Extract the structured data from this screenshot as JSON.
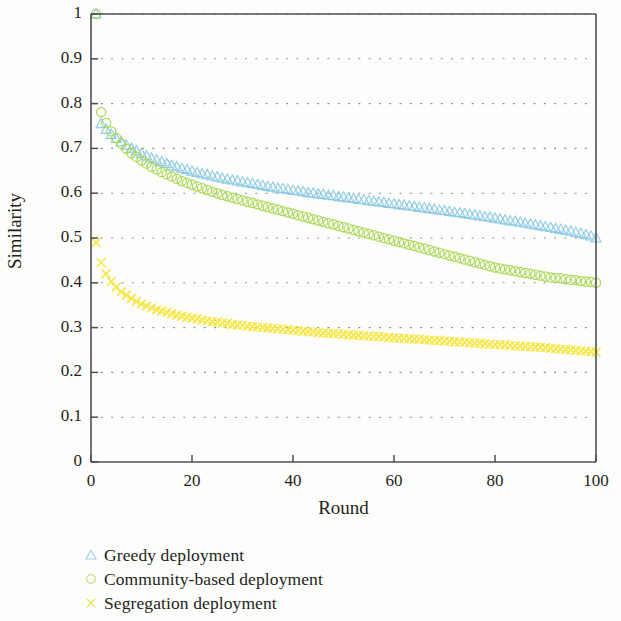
{
  "chart_data": {
    "type": "scatter",
    "title": "",
    "xlabel": "Round",
    "ylabel": "Similarity",
    "xlim": [
      0,
      100
    ],
    "ylim": [
      0,
      1
    ],
    "xticks": [
      "0",
      "20",
      "40",
      "60",
      "80",
      "100"
    ],
    "xtick_values": [
      0,
      20,
      40,
      60,
      80,
      100
    ],
    "yticks": [
      "0",
      "0.1",
      "0.2",
      "0.3",
      "0.4",
      "0.5",
      "0.6",
      "0.7",
      "0.8",
      "0.9",
      "1"
    ],
    "ytick_values": [
      0,
      0.1,
      0.2,
      0.3,
      0.4,
      0.5,
      0.6,
      0.7,
      0.8,
      0.9,
      1.0
    ],
    "grid": "dotted",
    "legend_position": "below-axes-left",
    "series": [
      {
        "name": "Greedy deployment",
        "marker": "triangle",
        "color": "#8ecae6",
        "x": [
          1,
          2,
          3,
          4,
          5,
          6,
          7,
          8,
          9,
          10,
          11,
          12,
          13,
          14,
          15,
          16,
          17,
          18,
          19,
          20,
          21,
          22,
          23,
          24,
          25,
          26,
          27,
          28,
          29,
          30,
          31,
          32,
          33,
          34,
          35,
          36,
          37,
          38,
          39,
          40,
          41,
          42,
          43,
          44,
          45,
          46,
          47,
          48,
          49,
          50,
          51,
          52,
          53,
          54,
          55,
          56,
          57,
          58,
          59,
          60,
          61,
          62,
          63,
          64,
          65,
          66,
          67,
          68,
          69,
          70,
          71,
          72,
          73,
          74,
          75,
          76,
          77,
          78,
          79,
          80,
          81,
          82,
          83,
          84,
          85,
          86,
          87,
          88,
          89,
          90,
          91,
          92,
          93,
          94,
          95,
          96,
          97,
          98,
          99,
          100
        ],
        "y": [
          1.0,
          0.755,
          0.742,
          0.731,
          0.722,
          0.714,
          0.707,
          0.7,
          0.694,
          0.688,
          0.683,
          0.678,
          0.674,
          0.67,
          0.666,
          0.662,
          0.659,
          0.655,
          0.652,
          0.649,
          0.646,
          0.643,
          0.641,
          0.638,
          0.636,
          0.633,
          0.631,
          0.629,
          0.627,
          0.625,
          0.623,
          0.621,
          0.619,
          0.617,
          0.615,
          0.613,
          0.611,
          0.61,
          0.608,
          0.606,
          0.605,
          0.603,
          0.601,
          0.6,
          0.598,
          0.597,
          0.595,
          0.594,
          0.592,
          0.591,
          0.589,
          0.588,
          0.586,
          0.585,
          0.583,
          0.582,
          0.58,
          0.579,
          0.577,
          0.576,
          0.574,
          0.573,
          0.571,
          0.57,
          0.568,
          0.567,
          0.565,
          0.564,
          0.562,
          0.561,
          0.559,
          0.557,
          0.556,
          0.554,
          0.552,
          0.551,
          0.549,
          0.547,
          0.546,
          0.544,
          0.542,
          0.54,
          0.538,
          0.537,
          0.535,
          0.533,
          0.531,
          0.529,
          0.527,
          0.525,
          0.523,
          0.521,
          0.519,
          0.517,
          0.515,
          0.512,
          0.51,
          0.507,
          0.504,
          0.5
        ]
      },
      {
        "name": "Community-based deployment",
        "marker": "circle",
        "color": "#a5d84f",
        "x": [
          1,
          2,
          3,
          4,
          5,
          6,
          7,
          8,
          9,
          10,
          11,
          12,
          13,
          14,
          15,
          16,
          17,
          18,
          19,
          20,
          21,
          22,
          23,
          24,
          25,
          26,
          27,
          28,
          29,
          30,
          31,
          32,
          33,
          34,
          35,
          36,
          37,
          38,
          39,
          40,
          41,
          42,
          43,
          44,
          45,
          46,
          47,
          48,
          49,
          50,
          51,
          52,
          53,
          54,
          55,
          56,
          57,
          58,
          59,
          60,
          61,
          62,
          63,
          64,
          65,
          66,
          67,
          68,
          69,
          70,
          71,
          72,
          73,
          74,
          75,
          76,
          77,
          78,
          79,
          80,
          81,
          82,
          83,
          84,
          85,
          86,
          87,
          88,
          89,
          90,
          91,
          92,
          93,
          94,
          95,
          96,
          97,
          98,
          99,
          100
        ],
        "y": [
          1.0,
          0.781,
          0.757,
          0.738,
          0.723,
          0.71,
          0.699,
          0.689,
          0.681,
          0.673,
          0.666,
          0.659,
          0.653,
          0.647,
          0.642,
          0.637,
          0.632,
          0.627,
          0.623,
          0.619,
          0.615,
          0.611,
          0.607,
          0.603,
          0.6,
          0.596,
          0.593,
          0.59,
          0.587,
          0.584,
          0.581,
          0.578,
          0.575,
          0.572,
          0.569,
          0.566,
          0.563,
          0.56,
          0.557,
          0.554,
          0.551,
          0.548,
          0.545,
          0.542,
          0.539,
          0.536,
          0.533,
          0.53,
          0.527,
          0.524,
          0.521,
          0.518,
          0.515,
          0.512,
          0.509,
          0.506,
          0.503,
          0.5,
          0.497,
          0.494,
          0.491,
          0.488,
          0.485,
          0.482,
          0.479,
          0.476,
          0.473,
          0.47,
          0.467,
          0.464,
          0.461,
          0.458,
          0.455,
          0.452,
          0.449,
          0.446,
          0.443,
          0.44,
          0.437,
          0.434,
          0.432,
          0.43,
          0.428,
          0.426,
          0.424,
          0.422,
          0.42,
          0.418,
          0.416,
          0.414,
          0.412,
          0.411,
          0.41,
          0.408,
          0.407,
          0.406,
          0.404,
          0.403,
          0.402,
          0.4
        ]
      },
      {
        "name": "Segregation deployment",
        "marker": "x",
        "color": "#f5e642",
        "x": [
          1,
          2,
          3,
          4,
          5,
          6,
          7,
          8,
          9,
          10,
          11,
          12,
          13,
          14,
          15,
          16,
          17,
          18,
          19,
          20,
          21,
          22,
          23,
          24,
          25,
          26,
          27,
          28,
          29,
          30,
          31,
          32,
          33,
          34,
          35,
          36,
          37,
          38,
          39,
          40,
          41,
          42,
          43,
          44,
          45,
          46,
          47,
          48,
          49,
          50,
          51,
          52,
          53,
          54,
          55,
          56,
          57,
          58,
          59,
          60,
          61,
          62,
          63,
          64,
          65,
          66,
          67,
          68,
          69,
          70,
          71,
          72,
          73,
          74,
          75,
          76,
          77,
          78,
          79,
          80,
          81,
          82,
          83,
          84,
          85,
          86,
          87,
          88,
          89,
          90,
          91,
          92,
          93,
          94,
          95,
          96,
          97,
          98,
          99,
          100
        ],
        "y": [
          0.49,
          0.445,
          0.42,
          0.403,
          0.39,
          0.38,
          0.372,
          0.365,
          0.359,
          0.353,
          0.348,
          0.344,
          0.34,
          0.337,
          0.334,
          0.331,
          0.328,
          0.326,
          0.323,
          0.321,
          0.319,
          0.317,
          0.315,
          0.313,
          0.312,
          0.31,
          0.309,
          0.307,
          0.306,
          0.305,
          0.303,
          0.302,
          0.301,
          0.3,
          0.299,
          0.298,
          0.297,
          0.296,
          0.295,
          0.294,
          0.293,
          0.292,
          0.291,
          0.29,
          0.289,
          0.288,
          0.287,
          0.287,
          0.286,
          0.285,
          0.284,
          0.283,
          0.283,
          0.282,
          0.281,
          0.28,
          0.28,
          0.279,
          0.278,
          0.277,
          0.277,
          0.276,
          0.275,
          0.274,
          0.274,
          0.273,
          0.272,
          0.271,
          0.271,
          0.27,
          0.269,
          0.268,
          0.268,
          0.267,
          0.266,
          0.265,
          0.265,
          0.264,
          0.263,
          0.262,
          0.262,
          0.261,
          0.26,
          0.259,
          0.259,
          0.258,
          0.257,
          0.256,
          0.256,
          0.255,
          0.254,
          0.253,
          0.252,
          0.251,
          0.25,
          0.249,
          0.248,
          0.247,
          0.246,
          0.245
        ]
      }
    ]
  },
  "axes": {
    "ylabel": "Similarity",
    "xlabel": "Round"
  },
  "legend": {
    "items": [
      {
        "label": "Greedy deployment",
        "marker": "triangle-marker",
        "color": "#8ecae6"
      },
      {
        "label": "Community-based deployment",
        "marker": "circle-marker",
        "color": "#a5d84f"
      },
      {
        "label": "Segregation deployment",
        "marker": "x-marker",
        "color": "#f5e642"
      }
    ]
  }
}
